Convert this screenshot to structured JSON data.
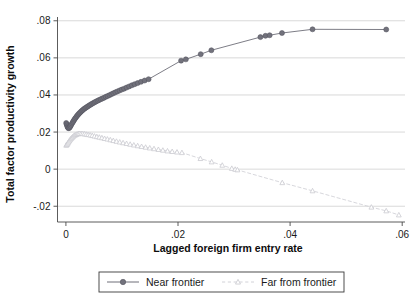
{
  "chart_data": {
    "type": "line",
    "title": "",
    "xlabel": "Lagged foreign firm entry rate",
    "ylabel": "Total factor productivity growth",
    "xlim": [
      -0.0015,
      0.0605
    ],
    "ylim": [
      -0.0285,
      0.0815
    ],
    "xticks": [
      0,
      0.02,
      0.04,
      0.06
    ],
    "xticklabels": [
      "0",
      ".02",
      ".04",
      ".06"
    ],
    "yticks": [
      -0.02,
      0,
      0.02,
      0.04,
      0.06,
      0.08
    ],
    "yticklabels": [
      "-.02",
      "0",
      ".02",
      ".04",
      ".06",
      ".08"
    ],
    "grid": true,
    "grid_axis": "y",
    "legend_position": "bottom-outside",
    "series": [
      {
        "name": "Near frontier",
        "marker": "filled-circle",
        "linestyle": "solid",
        "color": "#6e6e78",
        "marker_color": "#72727c",
        "points": [
          [
            5e-05,
            0.0249
          ],
          [
            0.00012,
            0.0243
          ],
          [
            0.0002,
            0.0236
          ],
          [
            0.00028,
            0.0229
          ],
          [
            0.00036,
            0.0224
          ],
          [
            0.00046,
            0.0221
          ],
          [
            0.00058,
            0.0222
          ],
          [
            0.0007,
            0.0226
          ],
          [
            0.00082,
            0.0232
          ],
          [
            0.00095,
            0.0239
          ],
          [
            0.00108,
            0.0246
          ],
          [
            0.00122,
            0.0253
          ],
          [
            0.00136,
            0.026
          ],
          [
            0.0015,
            0.0267
          ],
          [
            0.00164,
            0.0273
          ],
          [
            0.00178,
            0.0279
          ],
          [
            0.00193,
            0.0285
          ],
          [
            0.00208,
            0.0291
          ],
          [
            0.00223,
            0.0296
          ],
          [
            0.00239,
            0.0301
          ],
          [
            0.00255,
            0.0306
          ],
          [
            0.00272,
            0.0311
          ],
          [
            0.00289,
            0.0316
          ],
          [
            0.00307,
            0.032
          ],
          [
            0.00325,
            0.0325
          ],
          [
            0.00344,
            0.0329
          ],
          [
            0.00363,
            0.0333
          ],
          [
            0.00383,
            0.0337
          ],
          [
            0.00403,
            0.0341
          ],
          [
            0.00424,
            0.0345
          ],
          [
            0.00446,
            0.0349
          ],
          [
            0.00468,
            0.0353
          ],
          [
            0.00491,
            0.0357
          ],
          [
            0.00515,
            0.0361
          ],
          [
            0.0054,
            0.0365
          ],
          [
            0.00566,
            0.0369
          ],
          [
            0.00593,
            0.0373
          ],
          [
            0.00621,
            0.0377
          ],
          [
            0.0065,
            0.0381
          ],
          [
            0.0068,
            0.0385
          ],
          [
            0.00711,
            0.039
          ],
          [
            0.00743,
            0.0394
          ],
          [
            0.00776,
            0.0399
          ],
          [
            0.0081,
            0.0404
          ],
          [
            0.00845,
            0.0409
          ],
          [
            0.00881,
            0.0414
          ],
          [
            0.00918,
            0.0419
          ],
          [
            0.00956,
            0.0424
          ],
          [
            0.00996,
            0.0429
          ],
          [
            0.01038,
            0.0434
          ],
          [
            0.01082,
            0.044
          ],
          [
            0.01128,
            0.0446
          ],
          [
            0.01176,
            0.0452
          ],
          [
            0.01226,
            0.0458
          ],
          [
            0.0128,
            0.0464
          ],
          [
            0.0134,
            0.0471
          ],
          [
            0.01405,
            0.0478
          ],
          [
            0.01475,
            0.0485
          ],
          [
            0.02055,
            0.0585
          ],
          [
            0.0214,
            0.0592
          ],
          [
            0.02405,
            0.062
          ],
          [
            0.02595,
            0.0641
          ],
          [
            0.0347,
            0.0712
          ],
          [
            0.0356,
            0.0719
          ],
          [
            0.03635,
            0.0722
          ],
          [
            0.03855,
            0.0734
          ],
          [
            0.044,
            0.0754
          ],
          [
            0.05715,
            0.0753
          ]
        ]
      },
      {
        "name": "Far from frontier",
        "marker": "open-triangle",
        "linestyle": "dashed",
        "color": "#d2d2d8",
        "marker_color": "#cacad0",
        "points": [
          [
            5e-05,
            0.0129
          ],
          [
            0.00014,
            0.0131
          ],
          [
            0.00024,
            0.0135
          ],
          [
            0.00035,
            0.014
          ],
          [
            0.00047,
            0.0146
          ],
          [
            0.0006,
            0.0152
          ],
          [
            0.00074,
            0.0158
          ],
          [
            0.00089,
            0.0164
          ],
          [
            0.00105,
            0.0169
          ],
          [
            0.00122,
            0.0174
          ],
          [
            0.0014,
            0.0179
          ],
          [
            0.00159,
            0.0183
          ],
          [
            0.00179,
            0.0186
          ],
          [
            0.002,
            0.0189
          ],
          [
            0.00222,
            0.0191
          ],
          [
            0.00246,
            0.0192
          ],
          [
            0.00272,
            0.0192
          ],
          [
            0.003,
            0.0191
          ],
          [
            0.0033,
            0.019
          ],
          [
            0.00362,
            0.0188
          ],
          [
            0.00396,
            0.0186
          ],
          [
            0.00432,
            0.0184
          ],
          [
            0.0047,
            0.0181
          ],
          [
            0.0051,
            0.0178
          ],
          [
            0.00552,
            0.0175
          ],
          [
            0.00596,
            0.0172
          ],
          [
            0.00642,
            0.0169
          ],
          [
            0.0069,
            0.0165
          ],
          [
            0.0074,
            0.0162
          ],
          [
            0.00792,
            0.0158
          ],
          [
            0.00846,
            0.0154
          ],
          [
            0.00902,
            0.015
          ],
          [
            0.0096,
            0.0146
          ],
          [
            0.0102,
            0.0142
          ],
          [
            0.01082,
            0.0138
          ],
          [
            0.01146,
            0.0134
          ],
          [
            0.01212,
            0.013
          ],
          [
            0.0128,
            0.0126
          ],
          [
            0.0135,
            0.0122
          ],
          [
            0.01422,
            0.0118
          ],
          [
            0.01496,
            0.0114
          ],
          [
            0.01572,
            0.011
          ],
          [
            0.0165,
            0.0106
          ],
          [
            0.0173,
            0.0102
          ],
          [
            0.01812,
            0.0098
          ],
          [
            0.01896,
            0.0095
          ],
          [
            0.01982,
            0.0092
          ],
          [
            0.0207,
            0.0089
          ],
          [
            0.024,
            0.0057
          ],
          [
            0.026,
            0.0039
          ],
          [
            0.0279,
            0.0021
          ],
          [
            0.0296,
            0.0004
          ],
          [
            0.0302,
            -0.0001
          ],
          [
            0.0306,
            -0.0004
          ],
          [
            0.0386,
            -0.0073
          ],
          [
            0.044,
            -0.0117
          ],
          [
            0.0545,
            -0.0205
          ],
          [
            0.05715,
            -0.0225
          ],
          [
            0.0594,
            -0.0247
          ]
        ]
      }
    ]
  },
  "legend": {
    "items": [
      {
        "label": "Near frontier"
      },
      {
        "label": "Far from frontier"
      }
    ]
  },
  "colors": {
    "near_frontier": "#6e6e78",
    "far_from_frontier": "#d2d2d8",
    "gridline": "#c8c8c8",
    "axis": "#4a4a4a",
    "text": "#1a1a1a"
  }
}
